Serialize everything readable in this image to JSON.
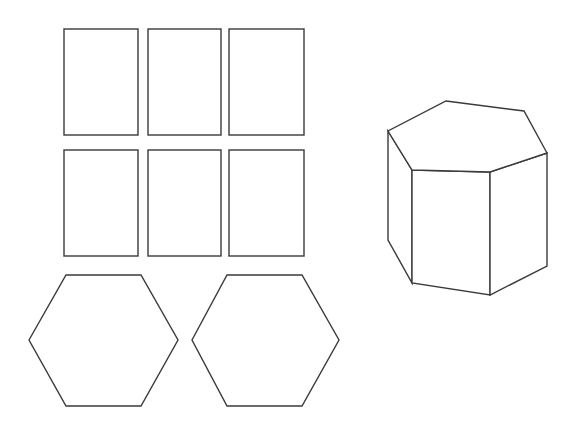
{
  "diagram": {
    "net": {
      "rectangles": {
        "count": 6,
        "label": "lateral faces"
      },
      "hexagons": {
        "count": 2,
        "label": "bases"
      }
    },
    "solid": {
      "label": "hexagonal prism",
      "faces": 8
    },
    "colors": {
      "stroke": "#3a3a3a",
      "fill": "#ffffff",
      "background": "#ffffff"
    }
  }
}
